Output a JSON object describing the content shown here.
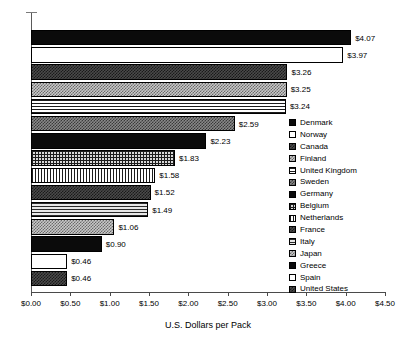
{
  "chart_data": {
    "type": "bar",
    "orientation": "horizontal",
    "title": "",
    "xlabel": "U.S. Dollars per Pack",
    "ylabel": "",
    "xlim": [
      0,
      4.5
    ],
    "xticks": [
      "$0.00",
      "$0.50",
      "$1.00",
      "$1.50",
      "$2.00",
      "$2.50",
      "$3.00",
      "$3.50",
      "$4.00",
      "$4.50"
    ],
    "xtick_values": [
      0,
      0.5,
      1.0,
      1.5,
      2.0,
      2.5,
      3.0,
      3.5,
      4.0,
      4.5
    ],
    "grid": false,
    "legend_position": "right",
    "categories": [
      "Denmark",
      "Norway",
      "Canada",
      "Finland",
      "United Kingdom",
      "Sweden",
      "Germany",
      "Belgium",
      "Netherlands",
      "France",
      "Italy",
      "Japan",
      "Greece",
      "Spain",
      "United States"
    ],
    "values": [
      4.07,
      3.97,
      3.26,
      3.25,
      3.24,
      2.59,
      2.23,
      1.83,
      1.58,
      1.52,
      1.49,
      1.06,
      0.9,
      0.46,
      0.46
    ],
    "bars": [
      {
        "label": "Denmark",
        "value": 4.07,
        "value_label": "$4.07",
        "pattern": "solid-black"
      },
      {
        "label": "Norway",
        "value": 3.97,
        "value_label": "$3.97",
        "pattern": "white"
      },
      {
        "label": "Canada",
        "value": 3.26,
        "value_label": "$3.26",
        "pattern": "check-dark"
      },
      {
        "label": "Finland",
        "value": 3.25,
        "value_label": "$3.25",
        "pattern": "check-light"
      },
      {
        "label": "United Kingdom",
        "value": 3.24,
        "value_label": "$3.24",
        "pattern": "hlines"
      },
      {
        "label": "Sweden",
        "value": 2.59,
        "value_label": "$2.59",
        "pattern": "check-mid"
      },
      {
        "label": "Germany",
        "value": 2.23,
        "value_label": "$2.23",
        "pattern": "solid-black"
      },
      {
        "label": "Belgium",
        "value": 1.83,
        "value_label": "$1.83",
        "pattern": "grid"
      },
      {
        "label": "Netherlands",
        "value": 1.58,
        "value_label": "$1.58",
        "pattern": "vlines"
      },
      {
        "label": "France",
        "value": 1.52,
        "value_label": "$1.52",
        "pattern": "check-dark"
      },
      {
        "label": "Italy",
        "value": 1.49,
        "value_label": "$1.49",
        "pattern": "hlines-gray"
      },
      {
        "label": "Japan",
        "value": 1.06,
        "value_label": "$1.06",
        "pattern": "check-light"
      },
      {
        "label": "Greece",
        "value": 0.9,
        "value_label": "$0.90",
        "pattern": "solid-black"
      },
      {
        "label": "Spain",
        "value": 0.46,
        "value_label": "$0.46",
        "pattern": "white"
      },
      {
        "label": "United States",
        "value": 0.46,
        "value_label": "$0.46",
        "pattern": "check-dark"
      }
    ]
  },
  "legend": {
    "items": [
      {
        "label": "Denmark",
        "pattern": "solid-black"
      },
      {
        "label": "Norway",
        "pattern": "white"
      },
      {
        "label": "Canada",
        "pattern": "check-dark"
      },
      {
        "label": "Finland",
        "pattern": "check-light"
      },
      {
        "label": "United Kingdom",
        "pattern": "hlines"
      },
      {
        "label": "Sweden",
        "pattern": "check-mid"
      },
      {
        "label": "Germany",
        "pattern": "solid-black"
      },
      {
        "label": "Belgium",
        "pattern": "grid"
      },
      {
        "label": "Netherlands",
        "pattern": "vlines"
      },
      {
        "label": "France",
        "pattern": "check-dark"
      },
      {
        "label": "Italy",
        "pattern": "hlines-gray"
      },
      {
        "label": "Japan",
        "pattern": "check-light"
      },
      {
        "label": "Greece",
        "pattern": "solid-black"
      },
      {
        "label": "Spain",
        "pattern": "white"
      },
      {
        "label": "United States",
        "pattern": "check-dark"
      }
    ]
  },
  "colors": {
    "axis": "#4a4a4a",
    "bar_outline": "#000000",
    "text": "#000000",
    "background": "#ffffff"
  }
}
